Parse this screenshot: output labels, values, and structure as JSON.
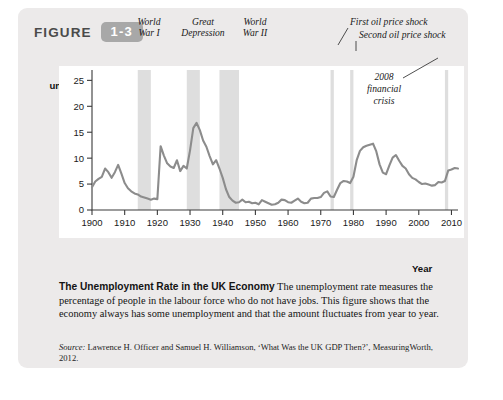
{
  "figure": {
    "word": "FIGURE",
    "number": "1-3"
  },
  "axes": {
    "ylabel_line1": "Per cent",
    "ylabel_line2": "unemployed",
    "xlabel": "Year"
  },
  "caption": {
    "title": "The Unemployment Rate in the UK Economy",
    "body": "The unemployment rate measures the percentage of people in the labour force who do not have jobs. This figure shows that the economy always has some unemployment and that the amount fluctuates from year to year."
  },
  "source": {
    "label": "Source:",
    "text": "Lawrence H. Officer and Samuel H. Williamson, ‘What Was the UK GDP Then?’, MeasuringWorth, 2012."
  },
  "colors": {
    "panel": "#eceaea",
    "badge": "#a8a8a8",
    "line": "#8c8c8c",
    "band": "#dedede",
    "axis": "#3a3a3a",
    "plot_background": "#ffffff"
  },
  "chart_data": {
    "type": "line",
    "title": "The Unemployment Rate in the UK Economy",
    "xlabel": "Year",
    "ylabel": "Per cent unemployed",
    "xlim": [
      1900,
      2012
    ],
    "ylim": [
      0,
      27
    ],
    "yticks": [
      0,
      5,
      10,
      15,
      20,
      25
    ],
    "xticks": [
      1900,
      1910,
      1920,
      1930,
      1940,
      1950,
      1960,
      1970,
      1980,
      1990,
      2000,
      2010
    ],
    "grid": false,
    "legend": "none",
    "series": [
      {
        "name": "UK unemployment rate",
        "color": "#8c8c8c",
        "x": [
          1900,
          1901,
          1902,
          1903,
          1904,
          1905,
          1906,
          1907,
          1908,
          1909,
          1910,
          1911,
          1912,
          1913,
          1914,
          1915,
          1916,
          1917,
          1918,
          1919,
          1920,
          1921,
          1922,
          1923,
          1924,
          1925,
          1926,
          1927,
          1928,
          1929,
          1930,
          1931,
          1932,
          1933,
          1934,
          1935,
          1936,
          1937,
          1938,
          1939,
          1940,
          1941,
          1942,
          1943,
          1944,
          1945,
          1946,
          1947,
          1948,
          1949,
          1950,
          1951,
          1952,
          1953,
          1954,
          1955,
          1956,
          1957,
          1958,
          1959,
          1960,
          1961,
          1962,
          1963,
          1964,
          1965,
          1966,
          1967,
          1968,
          1969,
          1970,
          1971,
          1972,
          1973,
          1974,
          1975,
          1976,
          1977,
          1978,
          1979,
          1980,
          1981,
          1982,
          1983,
          1984,
          1985,
          1986,
          1987,
          1988,
          1989,
          1990,
          1991,
          1992,
          1993,
          1994,
          1995,
          1996,
          1997,
          1998,
          1999,
          2000,
          2001,
          2002,
          2003,
          2004,
          2005,
          2006,
          2007,
          2008,
          2009,
          2010,
          2011,
          2012
        ],
        "y": [
          4.4,
          5.5,
          6.0,
          6.4,
          8.0,
          7.3,
          6.2,
          7.3,
          8.7,
          7.0,
          5.2,
          4.2,
          3.6,
          3.2,
          3.0,
          2.6,
          2.4,
          2.2,
          2.0,
          2.2,
          2.1,
          12.3,
          10.5,
          9.0,
          8.4,
          8.1,
          9.6,
          7.5,
          8.5,
          8.0,
          11.5,
          15.8,
          16.8,
          15.4,
          13.4,
          12.2,
          10.4,
          8.8,
          9.6,
          8.0,
          6.2,
          4.0,
          2.5,
          1.8,
          1.4,
          1.5,
          2.0,
          1.5,
          1.6,
          1.3,
          1.4,
          1.1,
          1.9,
          1.6,
          1.3,
          1.0,
          1.1,
          1.4,
          2.0,
          1.9,
          1.5,
          1.4,
          1.8,
          2.2,
          1.6,
          1.3,
          1.4,
          2.2,
          2.3,
          2.3,
          2.5,
          3.3,
          3.6,
          2.6,
          2.5,
          3.9,
          5.2,
          5.6,
          5.5,
          5.2,
          6.4,
          9.6,
          11.4,
          12.1,
          12.4,
          12.6,
          12.8,
          11.3,
          8.8,
          7.2,
          6.9,
          8.6,
          10.1,
          10.6,
          9.5,
          8.5,
          8.0,
          6.9,
          6.2,
          5.9,
          5.4,
          5.0,
          5.1,
          4.9,
          4.7,
          4.8,
          5.4,
          5.3,
          5.6,
          7.6,
          7.8,
          8.1,
          8.0
        ]
      }
    ],
    "shaded_bands": [
      {
        "label": "World War I",
        "start": 1914,
        "end": 1918
      },
      {
        "label": "Great Depression",
        "start": 1929,
        "end": 1933
      },
      {
        "label": "World War II",
        "start": 1939,
        "end": 1945
      },
      {
        "label": "First oil price shock",
        "start": 1973,
        "end": 1974
      },
      {
        "label": "Second oil price shock",
        "start": 1979,
        "end": 1980
      },
      {
        "label": "2008 financial crisis",
        "start": 2008,
        "end": 2009
      }
    ],
    "annotations": [
      {
        "text": "World\nWar I",
        "target_year": 1916
      },
      {
        "text": "Great\nDepression",
        "target_year": 1931
      },
      {
        "text": "World\nWar II",
        "target_year": 1942
      },
      {
        "text": "First oil price shock",
        "target_year": 1973
      },
      {
        "text": "Second oil price shock",
        "target_year": 1979
      },
      {
        "text": "2008\nfinancial\ncrisis",
        "target_year": 2008
      }
    ],
    "annotation_text": {
      "ww1_l1": "World",
      "ww1_l2": "War I",
      "gd_l1": "Great",
      "gd_l2": "Depression",
      "ww2_l1": "World",
      "ww2_l2": "War II",
      "oil1": "First oil price shock",
      "oil2": "Second oil price shock",
      "fc_l1": "2008",
      "fc_l2": "financial",
      "fc_l3": "crisis"
    },
    "ytick_labels": [
      "0",
      "5",
      "10",
      "15",
      "20",
      "25"
    ],
    "xtick_labels": [
      "1900",
      "1910",
      "1920",
      "1930",
      "1940",
      "1950",
      "1960",
      "1970",
      "1980",
      "1990",
      "2000",
      "2010"
    ]
  }
}
